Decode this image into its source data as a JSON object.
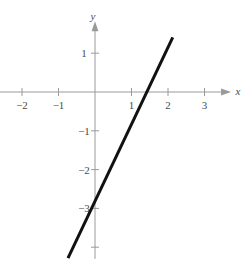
{
  "chart_data": {
    "type": "line",
    "title": "",
    "subtitle": "",
    "xlabel": "x",
    "ylabel": "y",
    "xlim": [
      -2.6,
      3.7
    ],
    "ylim": [
      -4.3,
      1.8
    ],
    "grid": false,
    "legend": "none",
    "axis_style": "cartesian-arrows",
    "xticks": [
      -2,
      -1,
      1,
      2,
      3
    ],
    "xtick_labels": [
      "−2",
      "−1",
      "1",
      "2",
      "3"
    ],
    "yticks": [
      1,
      -1,
      -2,
      -3,
      -4
    ],
    "ytick_labels": [
      "1",
      "−1",
      "−2",
      "−3",
      ""
    ],
    "series": [
      {
        "name": "y = 2x - 3",
        "equation": "y = 2x − 3",
        "slope": 2,
        "intercept": -3,
        "x": [
          -0.74,
          2.13
        ],
        "y": [
          -4.28,
          1.41
        ],
        "x_intercept": 1.5,
        "y_intercept": -3,
        "color": "#111111",
        "width": 3
      }
    ],
    "colors": {
      "axis": "#9a9a9a",
      "tick_text": "#4a4a4a",
      "curve": "#111111",
      "background": "#ffffff"
    },
    "origin_px": {
      "x": 95,
      "y": 92
    },
    "unit_px": {
      "x": 36.5,
      "y": 38.8
    }
  },
  "figure": {
    "caption": "",
    "x_axis_label": "x",
    "y_axis_label": "y"
  }
}
